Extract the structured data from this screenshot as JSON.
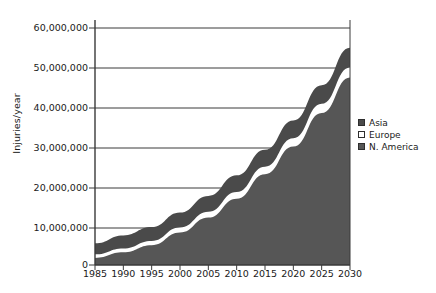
{
  "chart_data": {
    "type": "area",
    "stacked": true,
    "title": "",
    "xlabel": "",
    "ylabel": "Injuries/year",
    "x": [
      1985,
      1990,
      1995,
      2000,
      2005,
      2010,
      2015,
      2020,
      2025,
      2030
    ],
    "categories": [
      "1985",
      "1990",
      "1995",
      "2000",
      "2005",
      "2010",
      "2015",
      "2020",
      "2025",
      "2030"
    ],
    "xlim": [
      1985,
      2030
    ],
    "ylim": [
      0,
      60000000
    ],
    "yticks": [
      0,
      10000000,
      20000000,
      30000000,
      40000000,
      50000000,
      60000000
    ],
    "ytick_labels": [
      "0",
      "10,000,000",
      "20,000,000",
      "30,000,000",
      "40,000,000",
      "50,000,000",
      "60,000,000"
    ],
    "grid": true,
    "grid_axis": "y",
    "legend_position": "right",
    "series": [
      {
        "name": "N. America",
        "stack_order": 1,
        "color": "#565656",
        "values": [
          1800000,
          3200000,
          5000000,
          8200000,
          12000000,
          16800000,
          23000000,
          30000000,
          38500000,
          47500000
        ]
      },
      {
        "name": "Europe",
        "stack_order": 2,
        "color": "#ffffff",
        "values": [
          900000,
          1000000,
          1100000,
          1300000,
          1500000,
          1700000,
          1900000,
          2100000,
          2300000,
          2500000
        ]
      },
      {
        "name": "Asia",
        "stack_order": 3,
        "color": "#4a4a4a",
        "values": [
          2800000,
          3300000,
          3500000,
          3800000,
          4000000,
          4200000,
          4300000,
          4500000,
          4700000,
          5000000
        ]
      }
    ],
    "stack_totals": [
      5500000,
      7500000,
      9600000,
      13300000,
      17500000,
      22700000,
      29200000,
      36600000,
      45500000,
      55000000
    ]
  },
  "legend": {
    "entries": [
      {
        "label": "Asia",
        "color": "#4a4a4a"
      },
      {
        "label": "Europe",
        "color": "#ffffff"
      },
      {
        "label": "N. America",
        "color": "#565656"
      }
    ]
  },
  "axes": {
    "y_title": "Injuries/year",
    "y_tick_labels": [
      "60,000,000",
      "50,000,000",
      "40,000,000",
      "30,000,000",
      "20,000,000",
      "10,000,000",
      "0"
    ],
    "x_tick_labels": [
      "1985",
      "1990",
      "1995",
      "2000",
      "2005",
      "2010",
      "2015",
      "2020",
      "2025",
      "2030"
    ]
  },
  "colors": {
    "axis": "#3a3a3a",
    "grid": "#3a3a3a",
    "text": "#1a1a1a",
    "background": "#ffffff"
  }
}
